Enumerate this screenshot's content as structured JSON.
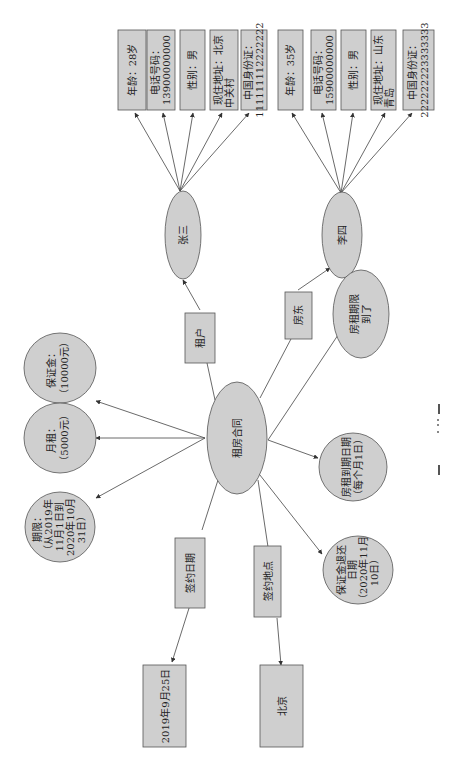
{
  "diagram": {
    "orientation": "rotated-90-ccw",
    "center": {
      "id": "contract",
      "label": "租房合同",
      "shape": "ellipse"
    },
    "relations": [
      {
        "id": "tenant",
        "label": "租户",
        "shape": "rect"
      },
      {
        "id": "landlord",
        "label": "房东",
        "shape": "rect"
      },
      {
        "id": "sign_date",
        "label": "签约日期",
        "shape": "rect"
      },
      {
        "id": "sign_place",
        "label": "签约地点",
        "shape": "rect"
      }
    ],
    "persons": [
      {
        "id": "zhangsan",
        "label": "张三",
        "attributes": [
          {
            "label": "年龄：28岁"
          },
          {
            "label": "电话号码：",
            "label2": "13900000000"
          },
          {
            "label": "性别：男"
          },
          {
            "label": "现住地址：北京",
            "label2": "中关村"
          },
          {
            "label": "中国身份证：",
            "label2": "111111112222222"
          }
        ]
      },
      {
        "id": "lisi",
        "label": "李四",
        "attributes": [
          {
            "label": "年龄：35岁"
          },
          {
            "label": "电话号码：",
            "label2": "15900000000"
          },
          {
            "label": "性别：男"
          },
          {
            "label": "现住地址：山东",
            "label2": "青岛"
          },
          {
            "label": "中国身份证：",
            "label2": "222222223333333"
          }
        ]
      }
    ],
    "terms": [
      {
        "id": "period",
        "lines": [
          "期限：",
          "（从2019年",
          "11月1日到",
          "2020年10月",
          "31日）"
        ]
      },
      {
        "id": "rent",
        "lines": [
          "月租：",
          "（5000元）"
        ]
      },
      {
        "id": "deposit",
        "lines": [
          "保证金：",
          "（10000元）"
        ]
      },
      {
        "id": "deposit_return",
        "lines": [
          "保证金退还",
          "日期",
          "（2020年11月",
          "10日）"
        ]
      },
      {
        "id": "rent_due",
        "lines": [
          "房租到期日期",
          "（每个月1日）"
        ]
      },
      {
        "id": "lease_expire",
        "lines": [
          "房租期限",
          "到了"
        ]
      }
    ],
    "values": [
      {
        "id": "date_value",
        "label": "2019年9月25日"
      },
      {
        "id": "place_value",
        "label": "北京"
      }
    ],
    "caption": "图"
  },
  "colors": {
    "fill": "#cfcfcf",
    "stroke": "#555555",
    "line": "#444444",
    "text": "#222222"
  }
}
